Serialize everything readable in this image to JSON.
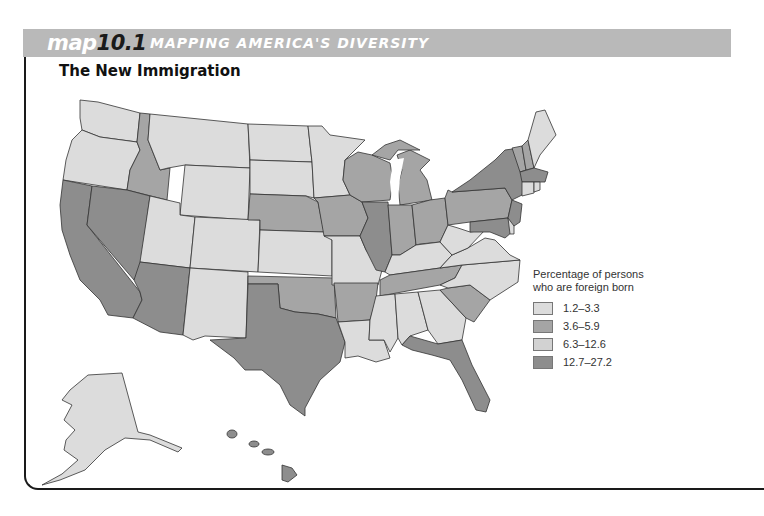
{
  "header": {
    "map_prefix": "map",
    "map_number": "10.1",
    "section_title": "MAPPING AMERICA'S DIVERSITY",
    "band_color": "#b9b9b9"
  },
  "map": {
    "title": "The New Immigration",
    "colors": {
      "cat1": "#dcdcdc",
      "cat2": "#a5a5a5",
      "cat3": "#d2d2d2",
      "cat4": "#8d8d8d",
      "border": "#333333"
    }
  },
  "legend": {
    "title_line1": "Percentage of persons",
    "title_line2": "who are foreign born",
    "items": [
      {
        "label": "1.2–3.3",
        "color": "#dcdcdc"
      },
      {
        "label": "3.6–5.9",
        "color": "#a5a5a5"
      },
      {
        "label": "6.3–12.6",
        "color": "#d2d2d2"
      },
      {
        "label": "12.7–27.2",
        "color": "#8d8d8d"
      }
    ]
  }
}
